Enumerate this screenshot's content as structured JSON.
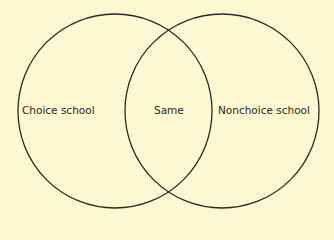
{
  "diagram": {
    "type": "venn",
    "background": "#fdf8d2",
    "stroke": "#2a2a22",
    "sets": [
      {
        "label": "Choice school"
      },
      {
        "label": "Nonchoice school"
      }
    ],
    "intersection": {
      "label": "Same"
    }
  }
}
